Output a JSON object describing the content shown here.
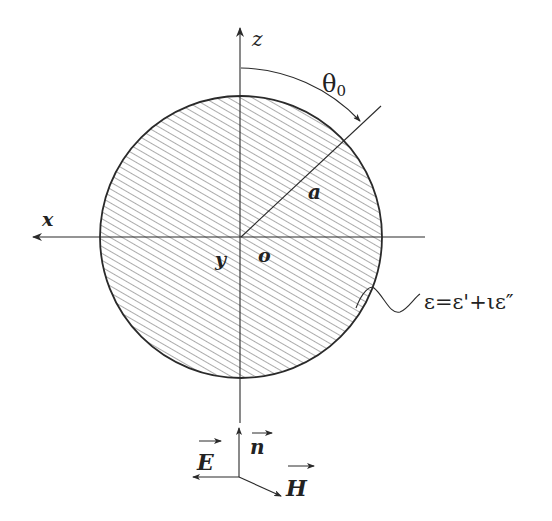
{
  "diagram": {
    "axes": {
      "x_label": "x",
      "y_label": "y",
      "z_label": "z",
      "origin_label": "o"
    },
    "sphere": {
      "radius_label": "a",
      "angle_label": "θ",
      "angle_subscript": "0",
      "permittivity_label": "ε=ε'+ιε″"
    },
    "wave_vectors": {
      "propagation_label": "n",
      "electric_label": "E",
      "magnetic_label": "H"
    },
    "colors": {
      "line": "#2a2a2a",
      "hatch": "#555555",
      "background": "#ffffff"
    }
  }
}
